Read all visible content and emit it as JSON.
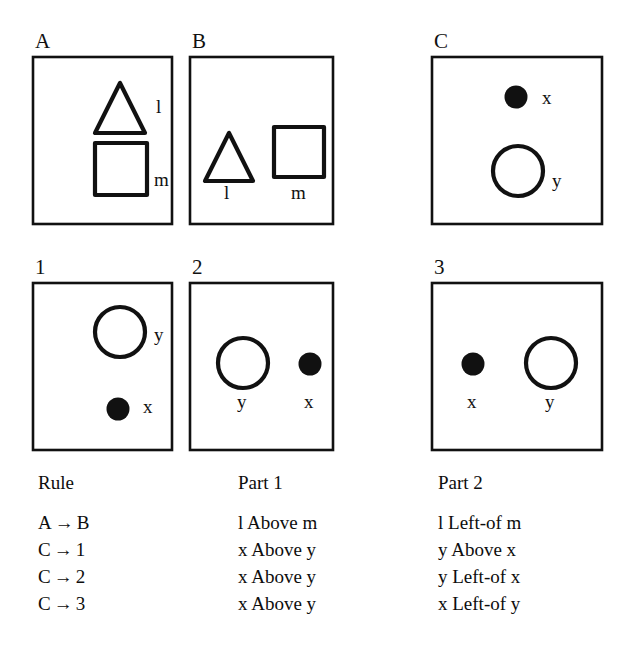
{
  "figure": {
    "title": "",
    "colors": {
      "ink": "#111111",
      "background": "#ffffff"
    },
    "panels": [
      {
        "id": "panel-a",
        "label": "A",
        "box": {
          "x": 33,
          "y": 57,
          "w": 139,
          "h": 167
        },
        "shapes": [
          {
            "name": "triangle",
            "kind": "triangle",
            "fill": "open",
            "cx": 120,
            "cy": 108,
            "size": 50,
            "label": "l",
            "label_x": 156,
            "label_y": 113
          },
          {
            "name": "square",
            "kind": "square",
            "fill": "open",
            "cx": 121,
            "cy": 169,
            "size": 52,
            "label": "m",
            "label_x": 154,
            "label_y": 186
          }
        ]
      },
      {
        "id": "panel-b",
        "label": "B",
        "box": {
          "x": 190,
          "y": 57,
          "w": 143,
          "h": 167
        },
        "shapes": [
          {
            "name": "triangle",
            "kind": "triangle",
            "fill": "open",
            "cx": 229,
            "cy": 157,
            "size": 48,
            "label": "l",
            "label_x": 224,
            "label_y": 199
          },
          {
            "name": "square",
            "kind": "square",
            "fill": "open",
            "cx": 299,
            "cy": 152,
            "size": 50,
            "label": "m",
            "label_x": 291,
            "label_y": 199
          }
        ]
      },
      {
        "id": "panel-c",
        "label": "C",
        "box": {
          "x": 432,
          "y": 57,
          "w": 170,
          "h": 167
        },
        "shapes": [
          {
            "name": "dot",
            "kind": "circle",
            "fill": "solid",
            "cx": 516,
            "cy": 97,
            "size": 23,
            "label": "x",
            "label_x": 542,
            "label_y": 104
          },
          {
            "name": "ring",
            "kind": "circle",
            "fill": "open",
            "cx": 518,
            "cy": 171,
            "size": 50,
            "label": "y",
            "label_x": 552,
            "label_y": 187
          }
        ]
      },
      {
        "id": "panel-1",
        "label": "1",
        "box": {
          "x": 33,
          "y": 283,
          "w": 139,
          "h": 167
        },
        "shapes": [
          {
            "name": "ring",
            "kind": "circle",
            "fill": "open",
            "cx": 120,
            "cy": 332,
            "size": 50,
            "label": "y",
            "label_x": 154,
            "label_y": 341
          },
          {
            "name": "dot",
            "kind": "circle",
            "fill": "solid",
            "cx": 118,
            "cy": 409,
            "size": 23,
            "label": "x",
            "label_x": 143,
            "label_y": 413
          }
        ]
      },
      {
        "id": "panel-2",
        "label": "2",
        "box": {
          "x": 190,
          "y": 283,
          "w": 143,
          "h": 167
        },
        "shapes": [
          {
            "name": "ring",
            "kind": "circle",
            "fill": "open",
            "cx": 243,
            "cy": 363,
            "size": 50,
            "label": "y",
            "label_x": 237,
            "label_y": 408
          },
          {
            "name": "dot",
            "kind": "circle",
            "fill": "solid",
            "cx": 310,
            "cy": 364,
            "size": 23,
            "label": "x",
            "label_x": 304,
            "label_y": 408
          }
        ]
      },
      {
        "id": "panel-3",
        "label": "3",
        "box": {
          "x": 432,
          "y": 283,
          "w": 170,
          "h": 167
        },
        "shapes": [
          {
            "name": "dot",
            "kind": "circle",
            "fill": "solid",
            "cx": 473,
            "cy": 364,
            "size": 23,
            "label": "x",
            "label_x": 467,
            "label_y": 408
          },
          {
            "name": "ring",
            "kind": "circle",
            "fill": "open",
            "cx": 551,
            "cy": 363,
            "size": 50,
            "label": "y",
            "label_x": 545,
            "label_y": 408
          }
        ]
      }
    ]
  },
  "legend": {
    "columns": [
      {
        "id": "rule-column",
        "heading": "Rule",
        "x": 38,
        "rows": [
          {
            "left": "A",
            "arrow": "→",
            "right": "B"
          },
          {
            "left": "C",
            "arrow": "→",
            "right": "1"
          },
          {
            "left": "C",
            "arrow": "→",
            "right": "2"
          },
          {
            "left": "C",
            "arrow": "→",
            "right": "3"
          }
        ]
      },
      {
        "id": "part-1-column",
        "heading": "Part 1",
        "x": 238,
        "rows": [
          {
            "text": "l Above m"
          },
          {
            "text": "x Above y"
          },
          {
            "text": "x Above y"
          },
          {
            "text": "x Above y"
          }
        ]
      },
      {
        "id": "part-2-column",
        "heading": "Part 2",
        "x": 438,
        "rows": [
          {
            "text": "l Left-of m"
          },
          {
            "text": "y Above x"
          },
          {
            "text": "y Left-of x"
          },
          {
            "text": "x Left-of y"
          }
        ]
      }
    ],
    "top": 473
  }
}
